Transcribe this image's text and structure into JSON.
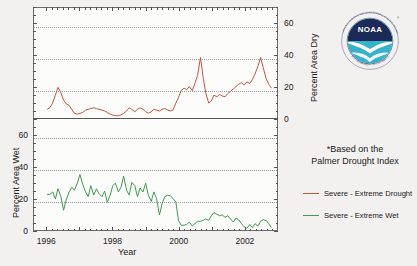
{
  "chart_data": {
    "type": "line",
    "title": "",
    "xlabel": "Year",
    "ylabel_top": "Percent Area Dry",
    "ylabel_bottom": "Percent Area Wet",
    "xlim": [
      1995.6,
      2003.0
    ],
    "x_ticks": [
      1996,
      1998,
      2000,
      2002
    ],
    "x_tick_labels": [
      "1996",
      "1998",
      "2000",
      "2002"
    ],
    "ylim_top": [
      0,
      70
    ],
    "ylim_bottom": [
      0,
      70
    ],
    "y_ticks_top": [
      0,
      20,
      40,
      60
    ],
    "y_tick_labels_top": [
      "0",
      "20",
      "40",
      "60"
    ],
    "y_ticks_bottom": [
      0,
      20,
      40,
      60
    ],
    "y_tick_labels_bottom": [
      "0",
      "20",
      "40",
      "60"
    ],
    "grid": true,
    "legend_position": "right",
    "annotation": "*Based on the Palmer Drought Index",
    "series": [
      {
        "name": "Severe - Extreme Drought",
        "color": "#c4553b",
        "panel": "top",
        "x": [
          1996.0,
          1996.08,
          1996.17,
          1996.25,
          1996.33,
          1996.42,
          1996.5,
          1996.58,
          1996.67,
          1996.75,
          1996.83,
          1996.92,
          1997.0,
          1997.08,
          1997.17,
          1997.25,
          1997.33,
          1997.42,
          1997.5,
          1997.58,
          1997.67,
          1997.75,
          1997.83,
          1997.92,
          1998.0,
          1998.08,
          1998.17,
          1998.25,
          1998.33,
          1998.42,
          1998.5,
          1998.58,
          1998.67,
          1998.75,
          1998.83,
          1998.92,
          1999.0,
          1999.08,
          1999.17,
          1999.25,
          1999.33,
          1999.42,
          1999.5,
          1999.58,
          1999.67,
          1999.75,
          1999.83,
          1999.92,
          2000.0,
          2000.08,
          2000.17,
          2000.25,
          2000.33,
          2000.42,
          2000.5,
          2000.58,
          2000.67,
          2000.75,
          2000.83,
          2000.92,
          2001.0,
          2001.08,
          2001.17,
          2001.25,
          2001.33,
          2001.42,
          2001.5,
          2001.58,
          2001.67,
          2001.75,
          2001.83,
          2001.92,
          2002.0,
          2002.08,
          2002.17,
          2002.25,
          2002.33,
          2002.42,
          2002.5,
          2002.58,
          2002.67,
          2002.75,
          2002.83
        ],
        "values": [
          5.5,
          6.5,
          9.5,
          14.5,
          19.5,
          16.0,
          11.5,
          9.0,
          8.0,
          5.5,
          3.0,
          2.5,
          3.0,
          3.5,
          5.0,
          5.5,
          6.0,
          6.5,
          6.0,
          5.5,
          5.0,
          4.5,
          3.5,
          2.5,
          1.8,
          1.5,
          1.5,
          2.0,
          3.0,
          4.5,
          6.5,
          5.5,
          4.0,
          5.5,
          6.5,
          5.5,
          4.0,
          3.0,
          4.0,
          5.5,
          5.0,
          4.5,
          5.5,
          6.0,
          5.0,
          4.5,
          5.0,
          9.5,
          13.0,
          17.5,
          19.0,
          18.0,
          20.0,
          17.5,
          22.0,
          27.0,
          38.5,
          26.0,
          16.0,
          9.5,
          11.0,
          14.5,
          13.5,
          15.0,
          14.0,
          13.5,
          15.5,
          17.0,
          18.5,
          20.0,
          21.5,
          22.5,
          21.0,
          23.0,
          22.0,
          24.5,
          28.0,
          33.0,
          38.5,
          32.0,
          25.0,
          21.5,
          19.0
        ]
      },
      {
        "name": "Severe - Extreme Wet",
        "color": "#3f9b4f",
        "panel": "bottom",
        "x": [
          1996.0,
          1996.08,
          1996.17,
          1996.25,
          1996.33,
          1996.42,
          1996.5,
          1996.58,
          1996.67,
          1996.75,
          1996.83,
          1996.92,
          1997.0,
          1997.08,
          1997.17,
          1997.25,
          1997.33,
          1997.42,
          1997.5,
          1997.58,
          1997.67,
          1997.75,
          1997.83,
          1997.92,
          1998.0,
          1998.08,
          1998.17,
          1998.25,
          1998.33,
          1998.42,
          1998.5,
          1998.58,
          1998.67,
          1998.75,
          1998.83,
          1998.92,
          1999.0,
          1999.08,
          1999.17,
          1999.25,
          1999.33,
          1999.42,
          1999.5,
          1999.58,
          1999.67,
          1999.75,
          1999.83,
          1999.92,
          2000.0,
          2000.08,
          2000.17,
          2000.25,
          2000.33,
          2000.42,
          2000.5,
          2000.58,
          2000.67,
          2000.75,
          2000.83,
          2000.92,
          2001.0,
          2001.08,
          2001.17,
          2001.25,
          2001.33,
          2001.42,
          2001.5,
          2001.58,
          2001.67,
          2001.75,
          2001.83,
          2001.92,
          2002.0,
          2002.08,
          2002.17,
          2002.25,
          2002.33,
          2002.42,
          2002.5,
          2002.58,
          2002.67,
          2002.75,
          2002.83
        ],
        "values": [
          22.5,
          22.5,
          24.0,
          19.5,
          26.0,
          21.0,
          12.5,
          19.0,
          24.0,
          27.0,
          25.0,
          29.5,
          35.0,
          29.0,
          24.0,
          21.0,
          28.0,
          22.0,
          26.0,
          23.0,
          21.0,
          24.5,
          17.5,
          22.0,
          28.0,
          29.5,
          24.0,
          27.0,
          34.0,
          25.0,
          22.0,
          30.0,
          28.0,
          21.0,
          26.5,
          24.0,
          29.5,
          22.0,
          18.0,
          24.0,
          20.0,
          9.5,
          16.5,
          21.0,
          22.0,
          21.5,
          20.0,
          17.5,
          6.0,
          3.0,
          3.0,
          3.5,
          5.0,
          2.5,
          4.0,
          5.5,
          5.5,
          6.0,
          7.0,
          6.0,
          9.0,
          11.0,
          10.0,
          9.0,
          9.5,
          8.0,
          9.0,
          7.0,
          5.0,
          7.5,
          6.5,
          4.0,
          2.0,
          1.0,
          3.5,
          1.5,
          4.0,
          2.5,
          5.5,
          6.5,
          6.0,
          4.0,
          1.5
        ]
      }
    ]
  },
  "axes": {
    "x_title": "Year",
    "y_title_top": "Percent Area Dry",
    "y_title_bottom": "Percent Area Wet"
  },
  "notes": {
    "line1": "*Based on the",
    "line2": "Palmer Drought Index"
  },
  "legend": {
    "items": [
      {
        "label": "Severe - Extreme Drought",
        "color": "#c4553b"
      },
      {
        "label": "Severe - Extreme Wet",
        "color": "#3f9b4f"
      }
    ]
  },
  "logo": {
    "name": "noaa-logo",
    "text": "NOAA",
    "ring_text_top": "NATIONAL OCEANIC AND ATMOSPHERIC ADMINISTRATION",
    "ring_text_bottom": "U.S. DEPARTMENT OF COMMERCE",
    "navy": "#1b2a57",
    "teal": "#35b3cc"
  }
}
